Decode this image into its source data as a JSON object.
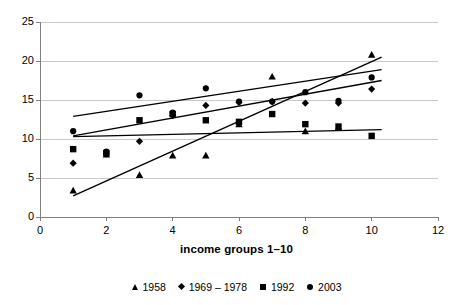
{
  "chart_data": {
    "type": "scatter",
    "title": "",
    "subtitle": "",
    "xlabel": "income groups 1–10",
    "ylabel": "",
    "xlim": [
      0,
      12
    ],
    "ylim": [
      0,
      25
    ],
    "xticks": [
      0,
      2,
      4,
      6,
      8,
      10,
      12
    ],
    "yticks": [
      0,
      5,
      10,
      15,
      20,
      25
    ],
    "grid": "horizontal",
    "legend_position": "bottom",
    "x": [
      1,
      2,
      3,
      4,
      5,
      6,
      7,
      8,
      9,
      10
    ],
    "series": [
      {
        "name": "1958",
        "marker": "triangle",
        "color": "#000000",
        "values": [
          3.4,
          8.0,
          5.4,
          7.9,
          7.9,
          11.9,
          18.0,
          11.0,
          11.5,
          20.8
        ],
        "trendline": {
          "x0": 1,
          "y0": 2.7,
          "x1": 10.3,
          "y1": 20.5
        }
      },
      {
        "name": "1969–1978",
        "marker": "diamond",
        "color": "#000000",
        "values": [
          6.9,
          8.1,
          9.7,
          13.0,
          14.3,
          14.7,
          14.8,
          14.6,
          14.6,
          16.4
        ],
        "trendline": {
          "x0": 1,
          "y0": 10.4,
          "x1": 10.3,
          "y1": 17.5
        }
      },
      {
        "name": "1992",
        "marker": "square",
        "color": "#000000",
        "values": [
          8.7,
          8.2,
          12.4,
          13.2,
          12.4,
          12.2,
          13.2,
          11.9,
          11.6,
          10.4
        ],
        "trendline": {
          "x0": 1,
          "y0": 10.3,
          "x1": 10.3,
          "y1": 11.2
        }
      },
      {
        "name": "2003",
        "marker": "circle",
        "color": "#000000",
        "values": [
          11.0,
          8.4,
          15.6,
          13.4,
          16.5,
          14.8,
          14.8,
          16.0,
          14.9,
          17.9
        ],
        "trendline": {
          "x0": 1,
          "y0": 12.9,
          "x1": 10.3,
          "y1": 18.9
        }
      }
    ]
  },
  "axis": {
    "y_tick_labels": [
      "25",
      "20",
      "15",
      "10",
      "5",
      "0"
    ],
    "x_tick_labels": [
      "0",
      "2",
      "4",
      "6",
      "8",
      "10",
      "12"
    ],
    "x_title": "income groups 1–10"
  },
  "legend": {
    "items": [
      {
        "label": "1958",
        "marker": "triangle-marker"
      },
      {
        "label": "1969 – 1978",
        "marker": "diamond-marker"
      },
      {
        "label": "1992",
        "marker": "square-marker"
      },
      {
        "label": "2003",
        "marker": "circle-marker"
      }
    ]
  },
  "colors": {
    "data": "#000000",
    "grid": "#c8c8c8",
    "axis": "#808080",
    "background": "#ffffff"
  }
}
